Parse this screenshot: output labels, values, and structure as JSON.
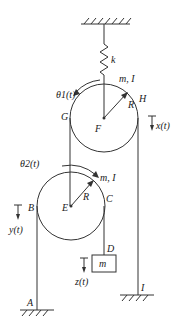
{
  "diagram": {
    "type": "pulley-spring-mass system",
    "labels": {
      "spring": "k",
      "upper_pulley_props": "m, I",
      "upper_pulley_center": "F",
      "upper_pulley_radius": "R",
      "upper_pulley_left": "G",
      "upper_pulley_right": "H",
      "upper_angle": "θ1(t)",
      "upper_disp": "x(t)",
      "lower_pulley_props": "m, I",
      "lower_pulley_center": "E",
      "lower_pulley_radius": "R",
      "lower_pulley_left": "B",
      "lower_pulley_right": "C",
      "lower_angle": "θ2(t)",
      "lower_disp": "y(t)",
      "hanging_point": "D",
      "mass": "m",
      "mass_disp": "z(t)",
      "ground_left": "A",
      "ground_right": "I"
    },
    "colors": {
      "line": "#333333",
      "background": "#ffffff"
    }
  }
}
